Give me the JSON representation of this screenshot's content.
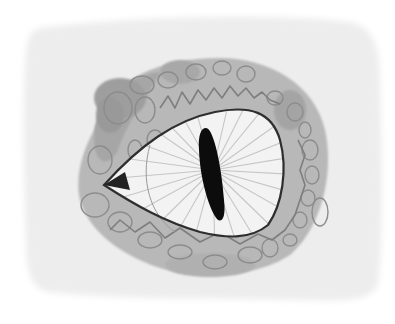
{
  "image": {
    "subject": "Watercolor illustration of a reptile eye with a vertical slit pupil",
    "alt": "Reptile eye watercolor",
    "colors": {
      "background": "#ffffff",
      "paper": "#ededed",
      "skin": "#b4b4b4",
      "skin_dark": "#9a9a9a",
      "scale_outline": "#8a8a8a",
      "sclera": "#f4f4f4",
      "iris_lines": "#c4c4c4",
      "pupil": "#0c0c0c",
      "eyelid_line": "#3a3a3a"
    }
  }
}
